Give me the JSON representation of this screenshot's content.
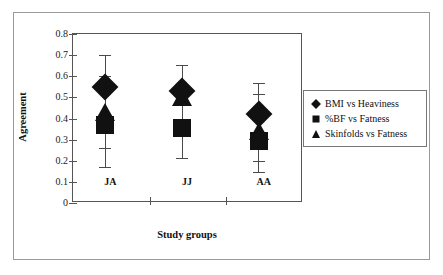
{
  "chart_data": {
    "type": "scatter",
    "title": "",
    "xlabel": "Study groups",
    "ylabel": "Agreement",
    "categories": [
      "JA",
      "JJ",
      "AA"
    ],
    "ylim": [
      0,
      0.8
    ],
    "yticks": [
      "0",
      "0.1",
      "0.2",
      "0.3",
      "0.4",
      "0.5",
      "0.6",
      "0.7",
      "0.8"
    ],
    "ytick_values": [
      0,
      0.1,
      0.2,
      0.3,
      0.4,
      0.5,
      0.6,
      0.7,
      0.8
    ],
    "grid": false,
    "legend_position": "right",
    "series": [
      {
        "name": "BMI vs Heaviness",
        "marker": "diamond",
        "color": "#111111",
        "values": [
          0.55,
          0.53,
          0.42
        ],
        "error_low": [
          0.26,
          0.4,
          0.2
        ],
        "error_high": [
          0.7,
          0.655,
          0.57
        ]
      },
      {
        "name": "%BF vs Fatness",
        "marker": "square",
        "color": "#111111",
        "values": [
          0.37,
          0.355,
          0.295
        ],
        "error_low": [
          0.17,
          0.215,
          0.145
        ],
        "error_high": [
          0.6,
          0.5,
          0.515
        ]
      },
      {
        "name": "Skinfolds vs Fatness",
        "marker": "triangle",
        "color": "#111111",
        "values": [
          0.43,
          0.5,
          0.34
        ],
        "error_low": [
          0.26,
          0.215,
          0.2
        ],
        "error_high": [
          0.6,
          0.655,
          0.515
        ]
      }
    ],
    "groups": [
      {
        "label": "JA",
        "whisker_low": 0.17,
        "whisker_high": 0.7,
        "inner_caps": [
          0.26,
          0.4,
          0.6
        ],
        "diamond": 0.55,
        "triangle": 0.43,
        "square": 0.37
      },
      {
        "label": "JJ",
        "whisker_low": 0.215,
        "whisker_high": 0.655,
        "inner_caps": [
          0.4
        ],
        "diamond": 0.53,
        "triangle": 0.5,
        "square": 0.355
      },
      {
        "label": "AA",
        "whisker_low": 0.145,
        "whisker_high": 0.57,
        "inner_caps": [
          0.2,
          0.515
        ],
        "diamond": 0.42,
        "triangle": 0.34,
        "square": 0.295
      }
    ]
  },
  "axes": {
    "y_title": "Agreement",
    "x_title": "Study groups"
  },
  "legend": {
    "entries": [
      {
        "label": "BMI vs Heaviness",
        "marker": "diamond"
      },
      {
        "label": "%BF vs Fatness",
        "marker": "square"
      },
      {
        "label": "Skinfolds vs Fatness",
        "marker": "triangle"
      }
    ]
  },
  "colors": {
    "marker": "#111111",
    "axis": "#555555",
    "errorbar": "#4a4a4a",
    "frame": "#9a9a9a",
    "background": "#ffffff"
  }
}
